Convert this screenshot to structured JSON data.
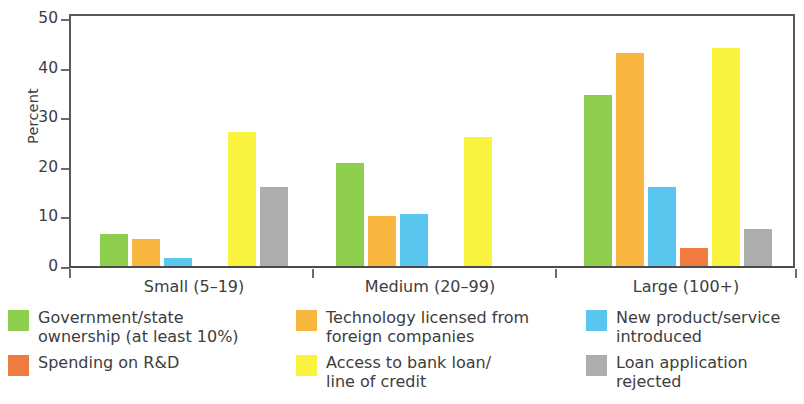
{
  "chart_data": {
    "type": "bar",
    "title": "",
    "xlabel": "",
    "ylabel": "Percent",
    "ylim": [
      0,
      50
    ],
    "yticks": [
      0,
      10,
      20,
      30,
      40,
      50
    ],
    "grid": false,
    "legend_position": "bottom",
    "categories": [
      "Small (5–19)",
      "Medium (20–99)",
      "Large (100+)"
    ],
    "series": [
      {
        "name": "Government/state ownership (at least 10%)",
        "color": "#8ECE4F",
        "values": [
          6.5,
          20.7,
          34.5
        ]
      },
      {
        "name": "Technology licensed from foreign companies",
        "color": "#F9B63E",
        "values": [
          5.5,
          10.0,
          43.0
        ]
      },
      {
        "name": "New product/service introduced",
        "color": "#58C6EE",
        "values": [
          1.7,
          10.5,
          16.0
        ]
      },
      {
        "name": "Spending on R&D",
        "color": "#F07B40",
        "values": [
          0,
          0,
          3.7
        ]
      },
      {
        "name": "Access to bank loan/line of credit",
        "color": "#FAF33E",
        "values": [
          27.0,
          26.0,
          44.0
        ]
      },
      {
        "name": "Loan application rejected",
        "color": "#ADADAD",
        "values": [
          16.0,
          0,
          7.5
        ]
      }
    ]
  },
  "axis": {
    "y_title": "Percent",
    "y_tick_labels": [
      "50",
      "40",
      "30",
      "20",
      "10",
      "0"
    ]
  },
  "x_labels": [
    "Small (5–19)",
    "Medium (20–99)",
    "Large (100+)"
  ],
  "legend": {
    "columns": [
      {
        "entries": [
          {
            "color": "#8ECE4F",
            "label": "Government/state\nownership (at least 10%)",
            "swatch_name": "legend-swatch-government-ownership"
          },
          {
            "color": "#F07B40",
            "label": "Spending on R&D",
            "swatch_name": "legend-swatch-rd-spending"
          }
        ]
      },
      {
        "entries": [
          {
            "color": "#F9B63E",
            "label": "Technology licensed from\nforeign companies",
            "swatch_name": "legend-swatch-technology-licensed"
          },
          {
            "color": "#FAF33E",
            "label": "Access to bank loan/\nline of credit",
            "swatch_name": "legend-swatch-bank-loan-access"
          }
        ]
      },
      {
        "entries": [
          {
            "color": "#58C6EE",
            "label": "New product/service\nintroduced",
            "swatch_name": "legend-swatch-new-product"
          },
          {
            "color": "#ADADAD",
            "label": "Loan application\nrejected",
            "swatch_name": "legend-swatch-loan-rejected"
          }
        ]
      }
    ]
  }
}
